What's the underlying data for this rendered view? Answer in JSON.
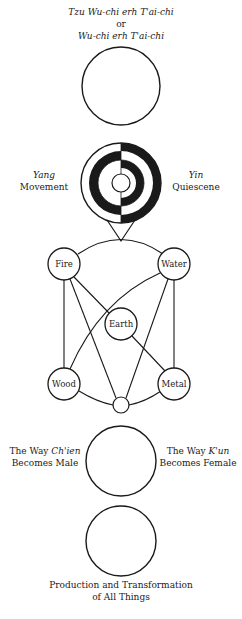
{
  "title": {
    "line1": "Tzu Wu-chi erh T'ai-chi",
    "line2": "or",
    "line3": "Wu-chi erh T'ai-chi"
  },
  "yang": {
    "name": "Yang",
    "label": "Movement"
  },
  "yin": {
    "name": "Yin",
    "label": "Quiescene"
  },
  "elements": {
    "fire": "Fire",
    "water": "Water",
    "earth": "Earth",
    "wood": "Wood",
    "metal": "Metal"
  },
  "chien": {
    "prefix": "The Way ",
    "name": "Ch'ien",
    "label": "Becomes Male"
  },
  "kun": {
    "prefix": "The Way ",
    "name": "K'un",
    "label": "Becomes Female"
  },
  "bottom": {
    "line1": "Production and Transformation",
    "line2": "of All Things"
  },
  "colors": {
    "stroke": "#1a1a1a",
    "background": "#ffffff"
  }
}
